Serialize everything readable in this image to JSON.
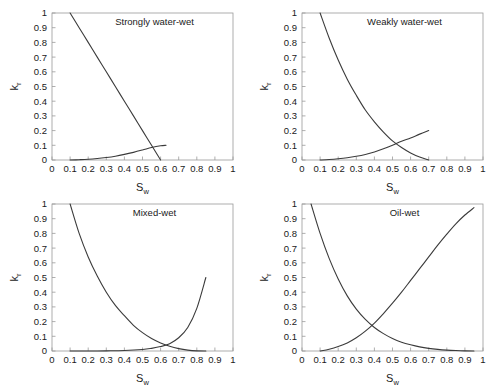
{
  "figure": {
    "panel_count": 4,
    "axis": {
      "xlabel": "S",
      "xlabel_sub": "w",
      "ylabel": "k",
      "ylabel_sub": "r",
      "xticks": [
        "0",
        "0.1",
        "0.2",
        "0.3",
        "0.4",
        "0.5",
        "0.6",
        "0.7",
        "0.8",
        "0.9",
        "1"
      ],
      "yticks": [
        "0",
        "0.1",
        "0.2",
        "0.3",
        "0.4",
        "0.5",
        "0.6",
        "0.7",
        "0.8",
        "0.9",
        "1"
      ],
      "xlim": [
        0,
        1
      ],
      "ylim": [
        0,
        1
      ]
    },
    "colors": {
      "curve": "#3b3b3b",
      "frame": "#9a9a9a",
      "text": "#1a1a1a",
      "background": "#ffffff"
    }
  },
  "chart_data": [
    {
      "type": "line",
      "title": "Strongly water-wet",
      "xlabel": "Sw",
      "ylabel": "kr",
      "xlim": [
        0,
        1
      ],
      "ylim": [
        0,
        1
      ],
      "grid": false,
      "legend": "none",
      "series": [
        {
          "name": "oil relative permeability",
          "x": [
            0.1,
            0.15,
            0.2,
            0.25,
            0.3,
            0.35,
            0.4,
            0.45,
            0.5,
            0.55,
            0.6
          ],
          "y": [
            1.0,
            0.9,
            0.8,
            0.7,
            0.6,
            0.5,
            0.4,
            0.3,
            0.2,
            0.1,
            0.0
          ]
        },
        {
          "name": "water relative permeability",
          "x": [
            0.1,
            0.15,
            0.2,
            0.25,
            0.3,
            0.35,
            0.4,
            0.45,
            0.5,
            0.55,
            0.6,
            0.63
          ],
          "y": [
            0.0,
            0.002,
            0.005,
            0.01,
            0.017,
            0.026,
            0.038,
            0.052,
            0.068,
            0.085,
            0.097,
            0.1
          ]
        }
      ]
    },
    {
      "type": "line",
      "title": "Weakly water-wet",
      "xlabel": "Sw",
      "ylabel": "kr",
      "xlim": [
        0,
        1
      ],
      "ylim": [
        0,
        1
      ],
      "grid": false,
      "legend": "none",
      "series": [
        {
          "name": "oil relative permeability",
          "x": [
            0.1,
            0.15,
            0.2,
            0.25,
            0.3,
            0.35,
            0.4,
            0.45,
            0.5,
            0.55,
            0.6,
            0.65,
            0.7
          ],
          "y": [
            1.0,
            0.83,
            0.68,
            0.55,
            0.44,
            0.34,
            0.26,
            0.19,
            0.13,
            0.085,
            0.048,
            0.02,
            0.0
          ]
        },
        {
          "name": "water relative permeability",
          "x": [
            0.1,
            0.15,
            0.2,
            0.25,
            0.3,
            0.35,
            0.4,
            0.45,
            0.5,
            0.55,
            0.6,
            0.65,
            0.7
          ],
          "y": [
            0.0,
            0.003,
            0.008,
            0.015,
            0.025,
            0.038,
            0.055,
            0.076,
            0.1,
            0.128,
            0.15,
            0.176,
            0.2
          ]
        }
      ]
    },
    {
      "type": "line",
      "title": "Mixed-wet",
      "xlabel": "Sw",
      "ylabel": "kr",
      "xlim": [
        0,
        1
      ],
      "ylim": [
        0,
        1
      ],
      "grid": false,
      "legend": "none",
      "series": [
        {
          "name": "oil relative permeability",
          "x": [
            0.1,
            0.15,
            0.2,
            0.25,
            0.3,
            0.35,
            0.4,
            0.45,
            0.5,
            0.55,
            0.6,
            0.65,
            0.7,
            0.75,
            0.8,
            0.85
          ],
          "y": [
            1.0,
            0.8,
            0.64,
            0.51,
            0.4,
            0.31,
            0.24,
            0.175,
            0.125,
            0.085,
            0.055,
            0.032,
            0.016,
            0.006,
            0.001,
            0.0
          ]
        },
        {
          "name": "water relative permeability",
          "x": [
            0.1,
            0.2,
            0.3,
            0.4,
            0.5,
            0.55,
            0.6,
            0.65,
            0.7,
            0.75,
            0.8,
            0.85
          ],
          "y": [
            0.0,
            0.0,
            0.001,
            0.003,
            0.01,
            0.018,
            0.03,
            0.05,
            0.09,
            0.16,
            0.29,
            0.5
          ]
        }
      ]
    },
    {
      "type": "line",
      "title": "Oil-wet",
      "xlabel": "Sw",
      "ylabel": "kr",
      "xlim": [
        0,
        1
      ],
      "ylim": [
        0,
        1
      ],
      "grid": false,
      "legend": "none",
      "series": [
        {
          "name": "oil relative permeability",
          "x": [
            0.05,
            0.1,
            0.15,
            0.2,
            0.25,
            0.3,
            0.35,
            0.4,
            0.45,
            0.5,
            0.55,
            0.6,
            0.65,
            0.7,
            0.75,
            0.8,
            0.85,
            0.9,
            0.95
          ],
          "y": [
            1.0,
            0.8,
            0.63,
            0.49,
            0.375,
            0.285,
            0.215,
            0.16,
            0.118,
            0.085,
            0.06,
            0.042,
            0.028,
            0.018,
            0.011,
            0.006,
            0.003,
            0.001,
            0.0
          ]
        },
        {
          "name": "water relative permeability",
          "x": [
            0.1,
            0.15,
            0.2,
            0.25,
            0.3,
            0.35,
            0.4,
            0.45,
            0.5,
            0.55,
            0.6,
            0.65,
            0.7,
            0.75,
            0.8,
            0.85,
            0.9,
            0.95
          ],
          "y": [
            0.0,
            0.012,
            0.03,
            0.055,
            0.09,
            0.135,
            0.19,
            0.255,
            0.325,
            0.4,
            0.48,
            0.56,
            0.64,
            0.72,
            0.795,
            0.865,
            0.925,
            0.975
          ]
        }
      ]
    }
  ]
}
